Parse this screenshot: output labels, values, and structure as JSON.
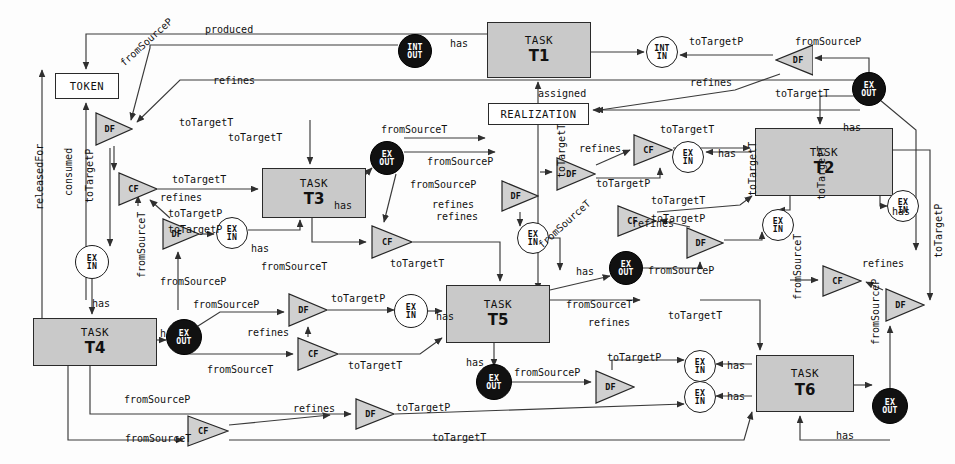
{
  "diagram": {
    "colors": {
      "task_fill": "#c9c9c9",
      "task_stroke": "#2a2a2a",
      "port_open_fill": "#ffffff",
      "port_filled_fill": "#111111",
      "gate_fill": "#d0d0d0",
      "edge_stroke": "#3a3a3a",
      "background": "#fdfdfd"
    },
    "tasks": [
      {
        "id": "task-t1",
        "kind": "TASK",
        "name": "T1",
        "x": 487,
        "y": 22,
        "w": 104,
        "h": 56
      },
      {
        "id": "task-t2",
        "kind": "TASK",
        "name": "T2",
        "x": 755,
        "y": 128,
        "w": 138,
        "h": 68
      },
      {
        "id": "task-t3",
        "kind": "TASK",
        "name": "T3",
        "x": 262,
        "y": 168,
        "w": 104,
        "h": 50
      },
      {
        "id": "task-t4",
        "kind": "TASK",
        "name": "T4",
        "x": 33,
        "y": 318,
        "w": 124,
        "h": 48
      },
      {
        "id": "task-t5",
        "kind": "TASK",
        "name": "T5",
        "x": 446,
        "y": 285,
        "w": 104,
        "h": 58
      },
      {
        "id": "task-t6",
        "kind": "TASK",
        "name": "T6",
        "x": 756,
        "y": 355,
        "w": 98,
        "h": 57
      }
    ],
    "boxes": [
      {
        "id": "box-token",
        "label": "TOKEN",
        "x": 55,
        "y": 73,
        "w": 64,
        "h": 26
      },
      {
        "id": "box-realization",
        "label": "REALIZATION",
        "x": 488,
        "y": 103,
        "w": 101,
        "h": 22
      }
    ],
    "ports": [
      {
        "id": "port-int-out-1",
        "type": "filled",
        "line1": "INT",
        "line2": "OUT",
        "cx": 415,
        "cy": 51,
        "r": 17
      },
      {
        "id": "port-int-in-1",
        "type": "open",
        "line1": "INT",
        "line2": "IN",
        "cx": 662,
        "cy": 52,
        "r": 16
      },
      {
        "id": "port-ex-out-1",
        "type": "filled",
        "line1": "EX",
        "line2": "OUT",
        "cx": 869,
        "cy": 89,
        "r": 17
      },
      {
        "id": "port-ex-in-1",
        "type": "open",
        "line1": "EX",
        "line2": "IN",
        "cx": 688,
        "cy": 157,
        "r": 16
      },
      {
        "id": "port-ex-out-2",
        "type": "filled",
        "line1": "EX",
        "line2": "OUT",
        "cx": 387,
        "cy": 158,
        "r": 17
      },
      {
        "id": "port-ex-in-2",
        "type": "open",
        "line1": "EX",
        "line2": "IN",
        "cx": 232,
        "cy": 233,
        "r": 16
      },
      {
        "id": "port-ex-in-3",
        "type": "open",
        "line1": "EX",
        "line2": "IN",
        "cx": 533,
        "cy": 238,
        "r": 16
      },
      {
        "id": "port-ex-in-4",
        "type": "open",
        "line1": "EX",
        "line2": "IN",
        "cx": 778,
        "cy": 225,
        "r": 16
      },
      {
        "id": "port-ex-in-5",
        "type": "open",
        "line1": "EX",
        "line2": "IN",
        "cx": 903,
        "cy": 206,
        "r": 16
      },
      {
        "id": "port-ex-in-6",
        "type": "open",
        "line1": "EX",
        "line2": "IN",
        "cx": 92,
        "cy": 262,
        "r": 17
      },
      {
        "id": "port-ex-out-3",
        "type": "filled",
        "line1": "EX",
        "line2": "OUT",
        "cx": 626,
        "cy": 268,
        "r": 17
      },
      {
        "id": "port-ex-in-7",
        "type": "open",
        "line1": "EX",
        "line2": "IN",
        "cx": 411,
        "cy": 311,
        "r": 17
      },
      {
        "id": "port-ex-out-4",
        "type": "filled",
        "line1": "EX",
        "line2": "OUT",
        "cx": 184,
        "cy": 337,
        "r": 18
      },
      {
        "id": "port-ex-out-5",
        "type": "filled",
        "line1": "EX",
        "line2": "OUT",
        "cx": 494,
        "cy": 382,
        "r": 18
      },
      {
        "id": "port-ex-in-8",
        "type": "open",
        "line1": "EX",
        "line2": "IN",
        "cx": 700,
        "cy": 366,
        "r": 16
      },
      {
        "id": "port-ex-in-9",
        "type": "open",
        "line1": "EX",
        "line2": "IN",
        "cx": 700,
        "cy": 397,
        "r": 16
      },
      {
        "id": "port-ex-out-6",
        "type": "filled",
        "line1": "EX",
        "line2": "OUT",
        "cx": 890,
        "cy": 406,
        "r": 18
      }
    ],
    "gates": [
      {
        "id": "gate-df-1",
        "label": "DF",
        "x": 95,
        "y": 112,
        "w": 38,
        "h": 34,
        "dir": "right"
      },
      {
        "id": "gate-df-2",
        "label": "DF",
        "x": 775,
        "y": 44,
        "w": 38,
        "h": 32,
        "dir": "left"
      },
      {
        "id": "gate-cf-1",
        "label": "CF",
        "x": 118,
        "y": 172,
        "w": 40,
        "h": 34,
        "dir": "right"
      },
      {
        "id": "gate-df-3",
        "label": "DF",
        "x": 162,
        "y": 218,
        "w": 38,
        "h": 32,
        "dir": "right"
      },
      {
        "id": "gate-cf-2",
        "label": "CF",
        "x": 633,
        "y": 134,
        "w": 40,
        "h": 32,
        "dir": "right"
      },
      {
        "id": "gate-df-4",
        "label": "DF",
        "x": 556,
        "y": 157,
        "w": 40,
        "h": 34,
        "dir": "right"
      },
      {
        "id": "gate-df-5",
        "label": "DF",
        "x": 501,
        "y": 180,
        "w": 38,
        "h": 32,
        "dir": "right"
      },
      {
        "id": "gate-cf-3",
        "label": "CF",
        "x": 371,
        "y": 225,
        "w": 42,
        "h": 34,
        "dir": "right"
      },
      {
        "id": "gate-cf-4",
        "label": "CF",
        "x": 617,
        "y": 205,
        "w": 40,
        "h": 32,
        "dir": "right"
      },
      {
        "id": "gate-df-6",
        "label": "DF",
        "x": 686,
        "y": 227,
        "w": 38,
        "h": 32,
        "dir": "right"
      },
      {
        "id": "gate-df-7",
        "label": "DF",
        "x": 288,
        "y": 293,
        "w": 40,
        "h": 34,
        "dir": "right"
      },
      {
        "id": "gate-cf-5",
        "label": "CF",
        "x": 297,
        "y": 337,
        "w": 42,
        "h": 34,
        "dir": "right"
      },
      {
        "id": "gate-cf-6",
        "label": "CF",
        "x": 822,
        "y": 265,
        "w": 40,
        "h": 32,
        "dir": "right"
      },
      {
        "id": "gate-df-8",
        "label": "DF",
        "x": 885,
        "y": 288,
        "w": 40,
        "h": 34,
        "dir": "right"
      },
      {
        "id": "gate-df-9",
        "label": "DF",
        "x": 595,
        "y": 370,
        "w": 40,
        "h": 34,
        "dir": "right"
      },
      {
        "id": "gate-df-10",
        "label": "DF",
        "x": 355,
        "y": 398,
        "w": 40,
        "h": 32,
        "dir": "right"
      },
      {
        "id": "gate-cf-7",
        "label": "CF",
        "x": 187,
        "y": 415,
        "w": 42,
        "h": 32,
        "dir": "right"
      }
    ],
    "edge_labels": [
      {
        "id": "lbl-produced",
        "text": "produced",
        "x": 205,
        "y": 24,
        "rot": 0
      },
      {
        "id": "lbl-has-1",
        "text": "has",
        "x": 450,
        "y": 38,
        "rot": 0
      },
      {
        "id": "lbl-totargetp-1",
        "text": "toTargetP",
        "x": 689,
        "y": 36,
        "rot": 0
      },
      {
        "id": "lbl-fromsourcep-1",
        "text": "fromSourceP",
        "x": 795,
        "y": 36,
        "rot": 0
      },
      {
        "id": "lbl-fromsourcep-2",
        "text": "fromSourceP",
        "x": 118,
        "y": 60,
        "rot": -42
      },
      {
        "id": "lbl-refines-1",
        "text": "refines",
        "x": 213,
        "y": 75,
        "rot": 0
      },
      {
        "id": "lbl-assigned",
        "text": "assigned",
        "x": 538,
        "y": 88,
        "rot": 0
      },
      {
        "id": "lbl-refines-2",
        "text": "refines",
        "x": 690,
        "y": 77,
        "rot": 0
      },
      {
        "id": "lbl-totargett-1",
        "text": "toTargetT",
        "x": 775,
        "y": 88,
        "rot": 0
      },
      {
        "id": "lbl-totargett-2",
        "text": "toTargetT",
        "x": 179,
        "y": 117,
        "rot": 0
      },
      {
        "id": "lbl-totargett-3",
        "text": "toTargetT",
        "x": 228,
        "y": 132,
        "rot": 0
      },
      {
        "id": "lbl-fromsourcet-1",
        "text": "fromSourceT",
        "x": 381,
        "y": 124,
        "rot": 0
      },
      {
        "id": "lbl-totargett-4",
        "text": "toTargetT",
        "x": 660,
        "y": 124,
        "rot": 0
      },
      {
        "id": "lbl-has-2",
        "text": "has",
        "x": 843,
        "y": 122,
        "rot": 0
      },
      {
        "id": "lbl-refines-3",
        "text": "refines",
        "x": 579,
        "y": 143,
        "rot": 0
      },
      {
        "id": "lbl-has-3",
        "text": "has",
        "x": 718,
        "y": 148,
        "rot": 0
      },
      {
        "id": "lbl-fromsourcep-3",
        "text": "fromSourceP",
        "x": 427,
        "y": 156,
        "rot": 0
      },
      {
        "id": "lbl-totargett-5",
        "text": "toTargetT",
        "x": 172,
        "y": 174,
        "rot": 0
      },
      {
        "id": "lbl-refines-4",
        "text": "refines",
        "x": 160,
        "y": 192,
        "rot": 0
      },
      {
        "id": "lbl-fromsourcep-4",
        "text": "fromSourceP",
        "x": 410,
        "y": 179,
        "rot": 0
      },
      {
        "id": "lbl-refines-5",
        "text": "refines",
        "x": 432,
        "y": 199,
        "rot": 0
      },
      {
        "id": "lbl-totargetp-2",
        "text": "toTargetP",
        "x": 596,
        "y": 178,
        "rot": 0
      },
      {
        "id": "lbl-totargett-6",
        "text": "toTargetT",
        "x": 651,
        "y": 195,
        "rot": 0
      },
      {
        "id": "lbl-totargetp-3",
        "text": "toTargetP",
        "x": 168,
        "y": 208,
        "rot": 0
      },
      {
        "id": "lbl-has-4",
        "text": "has",
        "x": 334,
        "y": 200,
        "rot": 0
      },
      {
        "id": "lbl-refines-6",
        "text": "refines",
        "x": 436,
        "y": 211,
        "rot": 0
      },
      {
        "id": "lbl-totargetp-4",
        "text": "toTargetP",
        "x": 168,
        "y": 224,
        "rot": 0
      },
      {
        "id": "lbl-refines-7",
        "text": "refines",
        "x": 632,
        "y": 218,
        "rot": 0
      },
      {
        "id": "lbl-totargetp-5",
        "text": "toTargetP",
        "x": 651,
        "y": 213,
        "rot": 0
      },
      {
        "id": "lbl-has-5",
        "text": "has",
        "x": 251,
        "y": 243,
        "rot": 0
      },
      {
        "id": "lbl-releasedfor",
        "text": "releasedFor",
        "x": 34,
        "y": 210,
        "rot": -90
      },
      {
        "id": "lbl-consumed",
        "text": "consumed",
        "x": 63,
        "y": 196,
        "rot": -90
      },
      {
        "id": "lbl-totargetp-6",
        "text": "toTargetP",
        "x": 84,
        "y": 203,
        "rot": -90
      },
      {
        "id": "lbl-fromsourcet-2",
        "text": "fromSourceT",
        "x": 136,
        "y": 278,
        "rot": -90
      },
      {
        "id": "lbl-fromsourcep-5",
        "text": "fromSourceP",
        "x": 160,
        "y": 276,
        "rot": 0
      },
      {
        "id": "lbl-fromsourcet-3",
        "text": "fromSourceT",
        "x": 261,
        "y": 261,
        "rot": 0
      },
      {
        "id": "lbl-totargett-7",
        "text": "toTargetT",
        "x": 390,
        "y": 258,
        "rot": 0
      },
      {
        "id": "lbl-fromsourcet-4",
        "text": "fromSourceT",
        "x": 536,
        "y": 242,
        "rot": -42
      },
      {
        "id": "lbl-has-6",
        "text": "has",
        "x": 576,
        "y": 266,
        "rot": 0
      },
      {
        "id": "lbl-fromsourcep-6",
        "text": "fromSourceP",
        "x": 648,
        "y": 265,
        "rot": 0
      },
      {
        "id": "lbl-totargett-8",
        "text": "toTargetT",
        "x": 556,
        "y": 178,
        "rot": -90
      },
      {
        "id": "lbl-totargett-9",
        "text": "toTargetT",
        "x": 747,
        "y": 196,
        "rot": -90
      },
      {
        "id": "lbl-totargett-10",
        "text": "toTargetT",
        "x": 816,
        "y": 200,
        "rot": -90
      },
      {
        "id": "lbl-fromsourcet-5",
        "text": "fromSourceT",
        "x": 792,
        "y": 300,
        "rot": -90
      },
      {
        "id": "lbl-totargetp-7",
        "text": "toTargetP",
        "x": 933,
        "y": 258,
        "rot": -90
      },
      {
        "id": "lbl-refines-8",
        "text": "refines",
        "x": 862,
        "y": 258,
        "rot": 0
      },
      {
        "id": "lbl-fromsourcep-7",
        "text": "fromSourceP",
        "x": 870,
        "y": 345,
        "rot": -90
      },
      {
        "id": "lbl-has-7",
        "text": "has",
        "x": 892,
        "y": 206,
        "rot": 0
      },
      {
        "id": "lbl-has-8",
        "text": "has",
        "x": 92,
        "y": 298,
        "rot": 0
      },
      {
        "id": "lbl-fromsourcep-8",
        "text": "fromSourceP",
        "x": 193,
        "y": 299,
        "rot": 0
      },
      {
        "id": "lbl-totargetp-8",
        "text": "toTargetP",
        "x": 331,
        "y": 293,
        "rot": 0
      },
      {
        "id": "lbl-has-9",
        "text": "has",
        "x": 160,
        "y": 328,
        "rot": 0
      },
      {
        "id": "lbl-refines-9",
        "text": "refines",
        "x": 247,
        "y": 327,
        "rot": 0
      },
      {
        "id": "lbl-has-10",
        "text": "has",
        "x": 436,
        "y": 311,
        "rot": 0
      },
      {
        "id": "lbl-fromsourcet-6",
        "text": "fromSourceT",
        "x": 207,
        "y": 364,
        "rot": 0
      },
      {
        "id": "lbl-totargett-11",
        "text": "toTargetT",
        "x": 348,
        "y": 360,
        "rot": 0
      },
      {
        "id": "lbl-fromsourcet-7",
        "text": "fromSourceT",
        "x": 566,
        "y": 299,
        "rot": 0
      },
      {
        "id": "lbl-refines-10",
        "text": "refines",
        "x": 588,
        "y": 317,
        "rot": 0
      },
      {
        "id": "lbl-totargett-12",
        "text": "toTargetT",
        "x": 668,
        "y": 310,
        "rot": 0
      },
      {
        "id": "lbl-has-11",
        "text": "has",
        "x": 466,
        "y": 357,
        "rot": 0
      },
      {
        "id": "lbl-fromsourcep-9",
        "text": "fromSourceP",
        "x": 514,
        "y": 367,
        "rot": 0
      },
      {
        "id": "lbl-totargetp-9",
        "text": "toTargetP",
        "x": 607,
        "y": 352,
        "rot": 0
      },
      {
        "id": "lbl-has-12",
        "text": "has",
        "x": 727,
        "y": 360,
        "rot": 0
      },
      {
        "id": "lbl-has-13",
        "text": "has",
        "x": 727,
        "y": 391,
        "rot": 0
      },
      {
        "id": "lbl-fromsourcep-10",
        "text": "fromSourceP",
        "x": 124,
        "y": 394,
        "rot": 0
      },
      {
        "id": "lbl-refines-11",
        "text": "refines",
        "x": 293,
        "y": 403,
        "rot": 0
      },
      {
        "id": "lbl-totargetp-10",
        "text": "toTargetP",
        "x": 396,
        "y": 402,
        "rot": 0
      },
      {
        "id": "lbl-fromsourcet-8",
        "text": "fromSourceT",
        "x": 125,
        "y": 433,
        "rot": 0
      },
      {
        "id": "lbl-totargett-13",
        "text": "toTargetT",
        "x": 432,
        "y": 432,
        "rot": 0
      },
      {
        "id": "lbl-has-14",
        "text": "has",
        "x": 836,
        "y": 430,
        "rot": 0
      }
    ],
    "legend": {
      "gate_types": [
        "DF",
        "CF"
      ],
      "port_types": [
        "INT OUT",
        "INT IN",
        "EX OUT",
        "EX IN"
      ],
      "relation_types": [
        "produced",
        "consumed",
        "releasedFor",
        "assigned",
        "has",
        "refines",
        "toTargetT",
        "toTargetP",
        "fromSourceT",
        "fromSourceP"
      ]
    }
  }
}
